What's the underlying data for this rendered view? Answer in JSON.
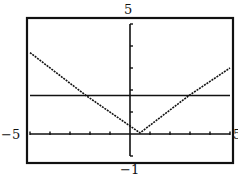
{
  "chart_data": {
    "type": "line",
    "title": "",
    "xlabel": "",
    "ylabel": "",
    "window": {
      "xmin": -5,
      "xmax": 5,
      "ymin": -1,
      "ymax": 5,
      "xscl": 1,
      "yscl": 1
    },
    "xlim": [
      -5,
      5
    ],
    "ylim": [
      -1,
      5
    ],
    "tick_labels": {
      "ymax": "5",
      "ymin": "−1",
      "xmin": "−5",
      "xmax": "5"
    },
    "grid": false,
    "legend": null,
    "series": [
      {
        "name": "V-shaped absolute value curve",
        "style": "dotted",
        "x": [
          -5,
          -2.2,
          0.5,
          2.95,
          5
        ],
        "y": [
          3.7,
          1.75,
          0.05,
          1.75,
          3.0
        ]
      },
      {
        "name": "horizontal line",
        "style": "solid",
        "x": [
          -5,
          5
        ],
        "y": [
          1.75,
          1.75
        ]
      }
    ],
    "intersections": [
      {
        "x": -2.2,
        "y": 1.75
      },
      {
        "x": 2.95,
        "y": 1.75
      }
    ]
  },
  "colors": {
    "ink": "#111111",
    "background": "#ffffff"
  }
}
